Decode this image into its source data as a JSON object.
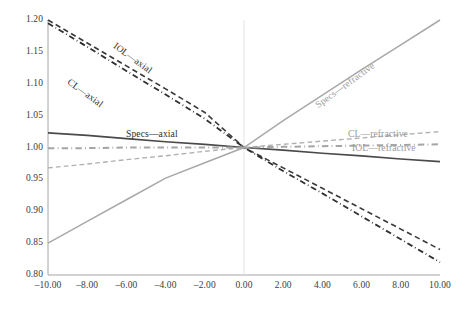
{
  "chart_data": {
    "type": "line",
    "title": "",
    "subtitle": "",
    "xlabel": "",
    "ylabel": "",
    "xlim": [
      -10,
      10
    ],
    "ylim": [
      0.8,
      1.2
    ],
    "x_ticks": [
      -10,
      -8,
      -6,
      -4,
      -2,
      0,
      2,
      4,
      6,
      8,
      10
    ],
    "x_tick_labels": [
      "–10.00",
      "–8.00",
      "–6.00",
      "–4.00",
      "–2.00",
      "0.00",
      "2.00",
      "4.00",
      "6.00",
      "8.00",
      "10.00"
    ],
    "y_ticks": [
      0.8,
      0.85,
      0.9,
      0.95,
      1.0,
      1.05,
      1.1,
      1.15,
      1.2
    ],
    "y_tick_labels": [
      "0.80",
      "0.85",
      "0.90",
      "0.95",
      "1.00",
      "1.05",
      "1.10",
      "1.15",
      "1.20"
    ],
    "grid": false,
    "legend_position": "inline-annotations",
    "x": [
      -10,
      -8,
      -6,
      -4,
      -2,
      0,
      2,
      4,
      6,
      8,
      10
    ],
    "series": [
      {
        "name": "CL—axial",
        "values": [
          1.2,
          1.164,
          1.128,
          1.092,
          1.055,
          1.0,
          0.968,
          0.936,
          0.904,
          0.872,
          0.84
        ],
        "color": "#3a3a3a",
        "style": "dashed",
        "width": 1.6,
        "label": "CL—axial",
        "label_x": 72,
        "label_y": 76,
        "label_rotation": 36,
        "label_class": "lbl-dark"
      },
      {
        "name": "IOL—axial",
        "values": [
          1.195,
          1.158,
          1.12,
          1.083,
          1.045,
          1.0,
          0.963,
          0.928,
          0.892,
          0.856,
          0.82
        ],
        "color": "#303030",
        "style": "dashdot",
        "width": 1.8,
        "label": "IOL—axial",
        "label_x": 118,
        "label_y": 40,
        "label_rotation": 36,
        "label_class": "lbl-dark"
      },
      {
        "name": "Specs—axial",
        "values": [
          1.023,
          1.019,
          1.014,
          1.009,
          1.005,
          1.0,
          0.996,
          0.991,
          0.987,
          0.982,
          0.978
        ],
        "color": "#4a4a4a",
        "style": "solid",
        "width": 1.7,
        "label": "Specs—axial",
        "label_x": 126,
        "label_y": 128,
        "label_rotation": 0,
        "label_class": "lbl-dark"
      },
      {
        "name": "Specs—refractive",
        "values": [
          0.85,
          0.884,
          0.918,
          0.952,
          0.976,
          1.0,
          1.042,
          1.082,
          1.122,
          1.161,
          1.2
        ],
        "color": "#a8a8a8",
        "style": "solid",
        "width": 1.5,
        "label": "Specs—refractive",
        "label_x": 313,
        "label_y": 101,
        "label_rotation": -36,
        "label_class": "lbl-gray"
      },
      {
        "name": "CL—refractive",
        "values": [
          0.968,
          0.974,
          0.981,
          0.987,
          0.994,
          1.0,
          1.005,
          1.01,
          1.015,
          1.02,
          1.025
        ],
        "color": "#b0b0b0",
        "style": "dashed",
        "width": 1.4,
        "label": "CL—refractive",
        "label_x": 348,
        "label_y": 128,
        "label_rotation": 0,
        "label_class": "lbl-gray"
      },
      {
        "name": "IOL—refractive",
        "values": [
          0.999,
          0.999,
          1.0,
          1.0,
          1.0,
          1.0,
          1.001,
          1.002,
          1.003,
          1.004,
          1.005
        ],
        "color": "#a5a5a5",
        "style": "dashdot",
        "width": 2.0,
        "label": "IOL—refractive",
        "label_x": 352,
        "label_y": 142,
        "label_rotation": 0,
        "label_class": "lbl-gray"
      }
    ],
    "axis_color": "#8c8c8c",
    "background": "#ffffff"
  }
}
